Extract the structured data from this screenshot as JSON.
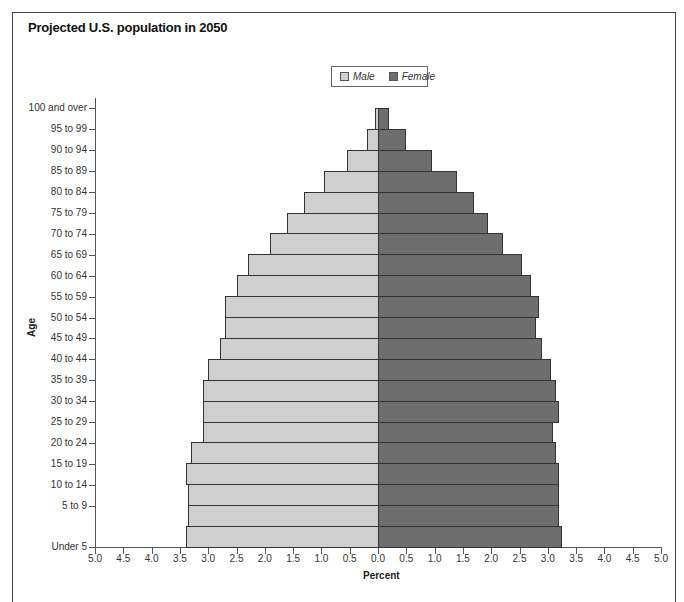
{
  "chart_data": {
    "type": "bar",
    "orientation": "horizontal-population-pyramid",
    "title": "Projected U.S. population in 2050",
    "xlabel": "Percent",
    "ylabel": "Age",
    "xlim": [
      -5.0,
      5.0
    ],
    "x_ticks": [
      "5.0",
      "4.5",
      "4.0",
      "3.5",
      "3.0",
      "2.5",
      "2.0",
      "1.5",
      "1.0",
      "0.5",
      "0.0",
      "0.5",
      "1.0",
      "1.5",
      "2.0",
      "2.5",
      "3.0",
      "3.5",
      "4.0",
      "4.5",
      "5.0"
    ],
    "legend": {
      "position": "top-center",
      "entries": [
        "Male",
        "Female"
      ]
    },
    "categories": [
      "100 and over",
      "95 to 99",
      "90 to 94",
      "85 to 89",
      "80 to 84",
      "75 to 79",
      "70 to 74",
      "65 to 69",
      "60 to 64",
      "55 to 59",
      "50 to 54",
      "45 to 49",
      "40 to 44",
      "35 to 39",
      "30 to 34",
      "25 to 29",
      "20 to 24",
      "15 to 19",
      "10 to 14",
      "5 to 9",
      "Under 5"
    ],
    "series": [
      {
        "name": "Male",
        "color": "#cfcfcf",
        "values": [
          0.05,
          0.2,
          0.55,
          0.95,
          1.3,
          1.6,
          1.9,
          2.3,
          2.5,
          2.7,
          2.7,
          2.8,
          3.0,
          3.1,
          3.1,
          3.1,
          3.3,
          3.4,
          3.35,
          3.35,
          3.4
        ]
      },
      {
        "name": "Female",
        "color": "#6e6e6e",
        "values": [
          0.2,
          0.5,
          0.95,
          1.4,
          1.7,
          1.95,
          2.2,
          2.55,
          2.7,
          2.85,
          2.8,
          2.9,
          3.05,
          3.15,
          3.2,
          3.1,
          3.15,
          3.2,
          3.2,
          3.2,
          3.25
        ]
      }
    ],
    "grid": false
  },
  "legend": {
    "male": "Male",
    "female": "Female"
  }
}
